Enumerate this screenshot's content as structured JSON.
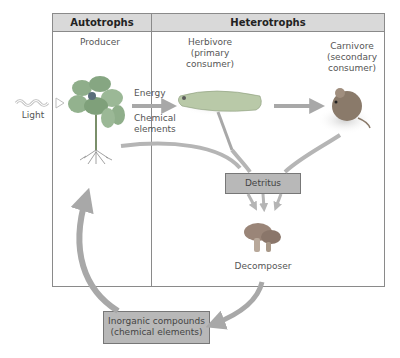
{
  "header": {
    "autotrophs": "Autotrophs",
    "heterotrophs": "Heterotrophs"
  },
  "nodes": {
    "light": "Light",
    "producer": "Producer",
    "herbivore": [
      "Herbivore",
      "(primary",
      "consumer)"
    ],
    "carnivore": [
      "Carnivore",
      "(secondary",
      "consumer)"
    ],
    "decomposer": "Decomposer",
    "detritus": "Detritus",
    "inorganic": [
      "Inorganic compounds",
      "(chemical elements)"
    ]
  },
  "flow_labels": {
    "energy": "Energy",
    "chemical": [
      "Chemical",
      "elements"
    ]
  },
  "colors": {
    "header_bg": "#d9d9d9",
    "frame_border": "#8a8a8a",
    "arrow": "#a8a8a8",
    "box_fill": "#b8b8b8",
    "plant_green": "#8fae8a",
    "caterpillar": "#b9c9a8",
    "mouse": "#8a7a6a",
    "mushroom": "#9a8578"
  }
}
